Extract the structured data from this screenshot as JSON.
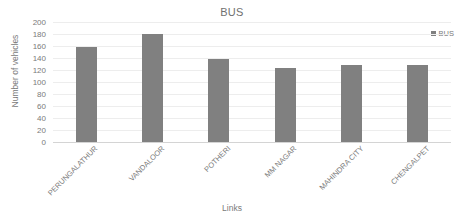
{
  "chart_data": {
    "type": "bar",
    "title": "BUS",
    "xlabel": "Links",
    "ylabel": "Number of vehicles",
    "categories": [
      "PERUNGALATHUR",
      "VANDALOOR",
      "POTHERI",
      "MM NAGAR",
      "MAHINDRA CITY",
      "CHENGALPET"
    ],
    "series": [
      {
        "name": "BUS",
        "values": [
          159,
          180,
          139,
          124,
          128,
          128
        ]
      }
    ],
    "ylim": [
      0,
      200
    ],
    "ytick_labels": [
      "200",
      "180",
      "160",
      "140",
      "120",
      "100",
      "80",
      "60",
      "40",
      "20",
      "0"
    ],
    "ytick_values": [
      200,
      180,
      160,
      140,
      120,
      100,
      80,
      60,
      40,
      20,
      0
    ],
    "grid": true,
    "legend_position": "top-right",
    "bar_color": "#808080",
    "gridline_color": "#ededed",
    "text_color": "#7a7a7a"
  },
  "legend": {
    "entries": [
      {
        "label": "BUS",
        "color": "#808080"
      }
    ]
  }
}
